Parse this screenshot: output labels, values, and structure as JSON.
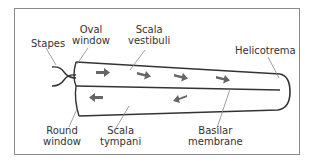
{
  "diagram": {
    "labels": {
      "stapes": "Stapes",
      "oval_window": [
        "Oval",
        "window"
      ],
      "scala_vestibuli": [
        "Scala",
        "vestibuli"
      ],
      "helicotrema": "Helicotrema",
      "round_window": [
        "Round",
        "window"
      ],
      "scala_tympani": [
        "Scala",
        "tympani"
      ],
      "basilar_membrane": [
        "Basilar",
        "membrane"
      ]
    },
    "arrows": {
      "upper_chamber_direction": "right",
      "upper_count": 4,
      "lower_chamber_direction": "left",
      "lower_count": 2
    },
    "colors": {
      "outline": "#333333",
      "arrow": "#666666",
      "leader_line": "#888888",
      "frame_border": "#8a8a8a"
    }
  }
}
